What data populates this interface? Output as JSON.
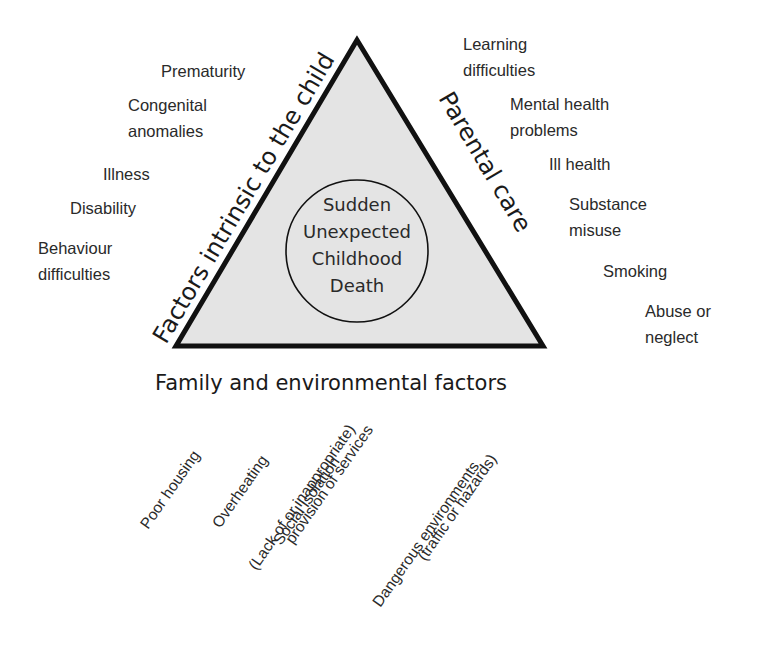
{
  "diagram": {
    "center": {
      "lines": [
        "Sudden",
        "Unexpected",
        "Childhood",
        "Death"
      ]
    },
    "sides": {
      "left": "Factors intrinsic to the child",
      "right": "Parental care",
      "bottom": "Family and environmental factors"
    },
    "left_factors": [
      {
        "lines": [
          "Prematurity"
        ]
      },
      {
        "lines": [
          "Congenital",
          "anomalies"
        ]
      },
      {
        "lines": [
          "Illness"
        ]
      },
      {
        "lines": [
          "Disability"
        ]
      },
      {
        "lines": [
          "Behaviour",
          "difficulties"
        ]
      }
    ],
    "right_factors": [
      {
        "lines": [
          "Learning",
          "difficulties"
        ]
      },
      {
        "lines": [
          "Mental health",
          "problems"
        ]
      },
      {
        "lines": [
          "Ill health"
        ]
      },
      {
        "lines": [
          "Substance",
          "misuse"
        ]
      },
      {
        "lines": [
          "Smoking"
        ]
      },
      {
        "lines": [
          "Abuse or",
          "neglect"
        ]
      }
    ],
    "bottom_factors": [
      {
        "lines": [
          "Poor housing"
        ]
      },
      {
        "lines": [
          "Overheating"
        ]
      },
      {
        "lines": [
          "Social isolation"
        ]
      },
      {
        "lines": [
          "(Lack of or inappropriate)",
          "provision of services"
        ]
      },
      {
        "lines": [
          "Dangerous environments",
          "(traffic or hazards)"
        ]
      }
    ],
    "colors": {
      "triangle_fill": "#e4e4e4",
      "stroke": "#111111",
      "text": "#2a2a2a"
    }
  }
}
